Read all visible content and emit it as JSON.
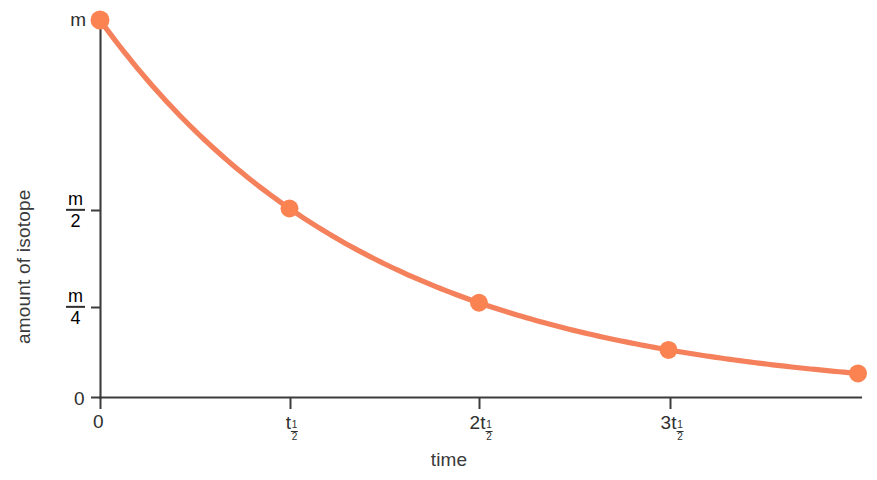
{
  "chart_data": {
    "type": "line",
    "title": "",
    "subtitle": "",
    "xlabel": "time",
    "ylabel": "amount of isotope",
    "grid": false,
    "legend": false,
    "legend_position": "none",
    "series_color": "#F4815C",
    "marker_color": "#FB8352",
    "axis_color": "#3c3c3c",
    "x": [
      0,
      1,
      2,
      3,
      4
    ],
    "xtick_labels": [
      "0",
      "t½",
      "2t½",
      "3t½"
    ],
    "xtick_parts": [
      {
        "coef": "",
        "sym": "0",
        "sub_num": "",
        "sub_den": ""
      },
      {
        "coef": "",
        "sym": "t",
        "sub_num": "1",
        "sub_den": "2"
      },
      {
        "coef": "2",
        "sym": "t",
        "sub_num": "1",
        "sub_den": "2"
      },
      {
        "coef": "3",
        "sym": "t",
        "sub_num": "1",
        "sub_den": "2"
      }
    ],
    "ytick_labels": [
      "0",
      "m/4",
      "m/2",
      "m"
    ],
    "ytick_parts": [
      {
        "kind": "plain",
        "text": "0"
      },
      {
        "kind": "fraction",
        "num": "m",
        "den": "4"
      },
      {
        "kind": "fraction",
        "num": "m",
        "den": "2"
      },
      {
        "kind": "plain",
        "text": "m"
      }
    ],
    "values": [
      1,
      0.5,
      0.25,
      0.125,
      0.0625
    ],
    "value_labels": [
      "m",
      "m/2",
      "m/4",
      "m/8",
      "m/16"
    ],
    "xlim": [
      0,
      4.1
    ],
    "ylim": [
      0,
      1.06
    ]
  },
  "axes": {
    "x_title": "time",
    "y_title": "amount of isotope",
    "origin_label_y": "0",
    "origin_label_x": "0"
  }
}
